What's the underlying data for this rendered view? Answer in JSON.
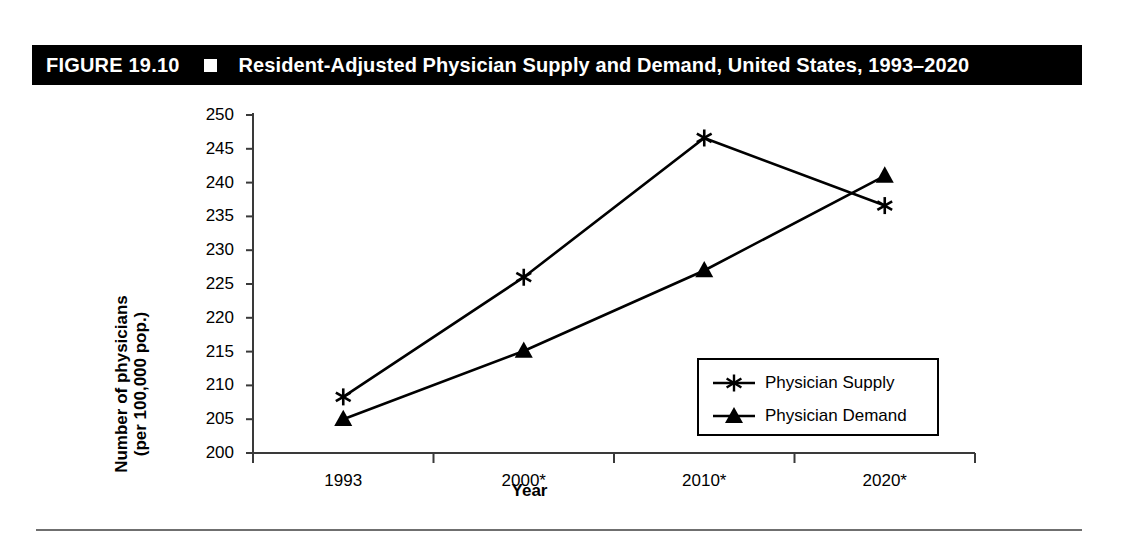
{
  "banner": {
    "figure_label": "FIGURE 19.10",
    "square_icon": "filled-square-icon",
    "title": "Resident-Adjusted Physician Supply and Demand, United States, 1993–2020",
    "background_color": "#000000",
    "text_color": "#ffffff"
  },
  "chart_data": {
    "type": "line",
    "title": "Resident-Adjusted Physician Supply and Demand, United States, 1993–2020",
    "subtitle": "",
    "xlabel": "Year",
    "ylabel": "Number of physicians (per 100,000 pop.)",
    "ylabel_lines": [
      "Number of physicians",
      "(per 100,000 pop.)"
    ],
    "categories": [
      "1993",
      "2000*",
      "2010*",
      "2020*"
    ],
    "ylim": [
      200,
      250
    ],
    "yticks": [
      200,
      205,
      210,
      215,
      220,
      225,
      230,
      235,
      240,
      245,
      250
    ],
    "grid": false,
    "legend_position": "inside-lower-right",
    "series": [
      {
        "name": "Physician Supply",
        "marker": "asterisk",
        "color": "#000000",
        "values": [
          208.3,
          226.0,
          246.6,
          236.6
        ]
      },
      {
        "name": "Physician Demand",
        "marker": "triangle",
        "color": "#000000",
        "values": [
          205.0,
          215.1,
          227.0,
          241.0
        ]
      }
    ],
    "annotations": []
  },
  "legend": {
    "entries": [
      {
        "label": "Physician Supply",
        "marker": "asterisk-marker-icon"
      },
      {
        "label": "Physician Demand",
        "marker": "triangle-marker-icon"
      }
    ]
  },
  "colors": {
    "ink": "#000000",
    "paper": "#ffffff",
    "axis": "#3a3a3a",
    "rule": "#6f6f6f"
  }
}
